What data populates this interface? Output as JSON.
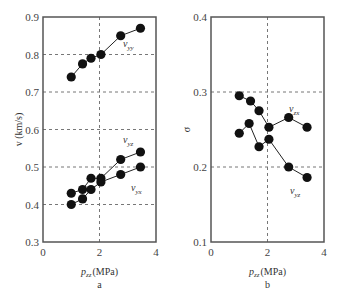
{
  "chart_data": [
    {
      "panel": "a",
      "type": "line",
      "xlabel": "p_zz (MPa)",
      "ylabel": "v (km/s)",
      "xlim": [
        0,
        4
      ],
      "ylim": [
        0.3,
        0.9
      ],
      "xticks": [
        "0",
        "2",
        "4"
      ],
      "yticks": [
        "0.3",
        "0.4",
        "0.5",
        "0.6",
        "0.7",
        "0.8",
        "0.9"
      ],
      "grid": "dashed at x=2 and each y tick",
      "series": [
        {
          "name": "v_yy",
          "x": [
            1.0,
            1.4,
            1.7,
            2.05,
            2.75,
            3.45
          ],
          "y": [
            0.74,
            0.775,
            0.79,
            0.8,
            0.85,
            0.87
          ]
        },
        {
          "name": "v_yz",
          "x": [
            1.0,
            1.4,
            1.7,
            2.05,
            2.75,
            3.45
          ],
          "y": [
            0.43,
            0.44,
            0.47,
            0.47,
            0.52,
            0.54
          ]
        },
        {
          "name": "v_yx",
          "x": [
            1.0,
            1.4,
            1.7,
            2.05,
            2.75,
            3.45
          ],
          "y": [
            0.4,
            0.415,
            0.44,
            0.46,
            0.48,
            0.5
          ]
        }
      ]
    },
    {
      "panel": "b",
      "type": "line",
      "xlabel": "p_zz (MPa)",
      "ylabel": "σ",
      "xlim": [
        0,
        4
      ],
      "ylim": [
        0.1,
        0.4
      ],
      "xticks": [
        "0",
        "2",
        "4"
      ],
      "yticks": [
        "0.1",
        "0.2",
        "0.3",
        "0.4"
      ],
      "grid": "dashed at x=2 and y=0.2, 0.3",
      "series": [
        {
          "name": "v_zx",
          "x": [
            1.0,
            1.4,
            1.7,
            2.05,
            2.75,
            3.4
          ],
          "y": [
            0.295,
            0.288,
            0.275,
            0.253,
            0.266,
            0.253
          ]
        },
        {
          "name": "v_yz",
          "x": [
            1.0,
            1.35,
            1.7,
            2.05,
            2.75,
            3.4
          ],
          "y": [
            0.245,
            0.258,
            0.227,
            0.237,
            0.2,
            0.186
          ]
        }
      ]
    }
  ],
  "labels": {
    "a": {
      "sublabel": "a",
      "ylabel": "v (km/s)",
      "xlabel_p": "p",
      "xlabel_sub": "zz",
      "xlabel_unit": "(MPa)",
      "series_labels": [
        "v_yy",
        "v_yz",
        "v_yx"
      ]
    },
    "b": {
      "sublabel": "b",
      "ylabel": "σ",
      "xlabel_p": "p",
      "xlabel_sub": "zz",
      "xlabel_unit": "(MPa)",
      "series_labels": [
        "v_zx",
        "v_yz"
      ]
    }
  }
}
